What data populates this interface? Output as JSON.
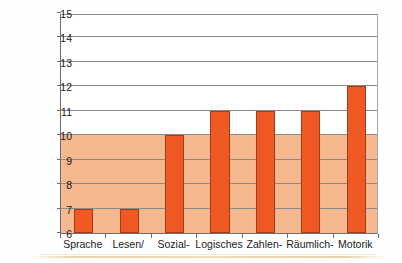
{
  "chart_data": {
    "type": "bar",
    "title": "",
    "subtitle": "",
    "xlabel": "",
    "ylabel": "Entwicklungsalter in Jahren",
    "categories": [
      "Sprache",
      "Lesen/",
      "Sozial-",
      "Logisches",
      "Zahlen-",
      "Räumlich-",
      "Motorik"
    ],
    "values": [
      7,
      7,
      10,
      11,
      11,
      11,
      12
    ],
    "ylim": [
      6,
      15
    ],
    "ytick_labels": [
      "6",
      "7",
      "8",
      "9",
      "10",
      "11",
      "12",
      "13",
      "14",
      "15"
    ],
    "ytick_values": [
      6,
      7,
      8,
      9,
      10,
      11,
      12,
      13,
      14,
      15
    ],
    "grid": true,
    "legend": false,
    "legend_position": "none",
    "bar_color": "#ef5a24",
    "bar_edge_color": "#a8381a",
    "band_color": "#f6b88f",
    "band_range": [
      6,
      10
    ],
    "gridline_color": "#8a8a8a",
    "axis_color": "#6e6e6e",
    "background_color": "#ffffff",
    "annotations": []
  }
}
